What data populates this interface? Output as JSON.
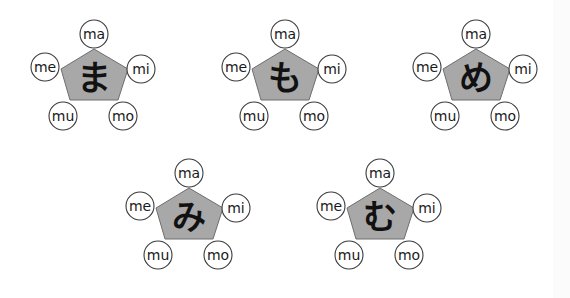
{
  "diagram": {
    "syllable_labels": [
      "ma",
      "mi",
      "mo",
      "mu",
      "me"
    ],
    "colors": {
      "pentagon_fill": "#a8a8a8",
      "pentagon_stroke": "#6e6e6e",
      "circle_fill": "#ffffff",
      "circle_stroke": "#3a3a3a",
      "text": "#111111"
    },
    "items": [
      {
        "kana": "ま",
        "reading": "ma",
        "labels": {
          "top": "ma",
          "right": "mi",
          "bottom_right": "mo",
          "bottom_left": "mu",
          "left": "me"
        }
      },
      {
        "kana": "も",
        "reading": "mo",
        "labels": {
          "top": "ma",
          "right": "mi",
          "bottom_right": "mo",
          "bottom_left": "mu",
          "left": "me"
        }
      },
      {
        "kana": "め",
        "reading": "me",
        "labels": {
          "top": "ma",
          "right": "mi",
          "bottom_right": "mo",
          "bottom_left": "mu",
          "left": "me"
        }
      },
      {
        "kana": "み",
        "reading": "mi",
        "labels": {
          "top": "ma",
          "right": "mi",
          "bottom_right": "mo",
          "bottom_left": "mu",
          "left": "me"
        }
      },
      {
        "kana": "む",
        "reading": "mu",
        "labels": {
          "top": "ma",
          "right": "mi",
          "bottom_right": "mo",
          "bottom_left": "mu",
          "left": "me"
        }
      }
    ]
  }
}
